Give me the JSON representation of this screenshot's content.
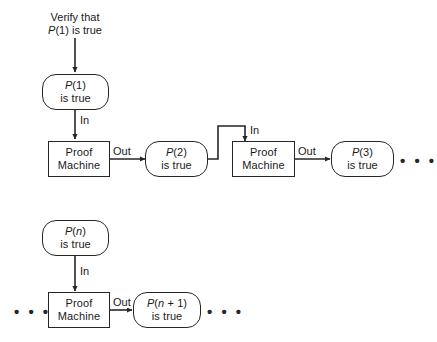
{
  "diagram": {
    "colors": {
      "stroke": "#262626",
      "background": "#ffffff",
      "text": "#1a1a1a"
    },
    "caption": {
      "line1": "Verify that",
      "line2_var": "P",
      "line2_rest": "(1) is true"
    },
    "wire_labels": {
      "in": "In",
      "out": "Out"
    },
    "ellipsis": {
      "glyph": "• • •"
    },
    "nodes": [
      {
        "id": "p1",
        "shape": "rounded",
        "var": "P",
        "arg": "(1)",
        "line2": "is true"
      },
      {
        "id": "proof-machine-1",
        "shape": "rect",
        "line1": "Proof",
        "line2": "Machine"
      },
      {
        "id": "p2",
        "shape": "rounded",
        "var": "P",
        "arg": "(2)",
        "line2": "is true"
      },
      {
        "id": "proof-machine-2",
        "shape": "rect",
        "line1": "Proof",
        "line2": "Machine"
      },
      {
        "id": "p3",
        "shape": "rounded",
        "var": "P",
        "arg": "(3)",
        "line2": "is true"
      },
      {
        "id": "pn",
        "shape": "rounded",
        "var": "P",
        "arg_pre": "(",
        "arg_var": "n",
        "arg_post": ")",
        "line2": "is true"
      },
      {
        "id": "proof-machine-3",
        "shape": "rect",
        "line1": "Proof",
        "line2": "Machine"
      },
      {
        "id": "pn1",
        "shape": "rounded",
        "var": "P",
        "arg_pre": "(",
        "arg_var": "n",
        "arg_post": " + 1)",
        "line2": "is true"
      }
    ]
  }
}
